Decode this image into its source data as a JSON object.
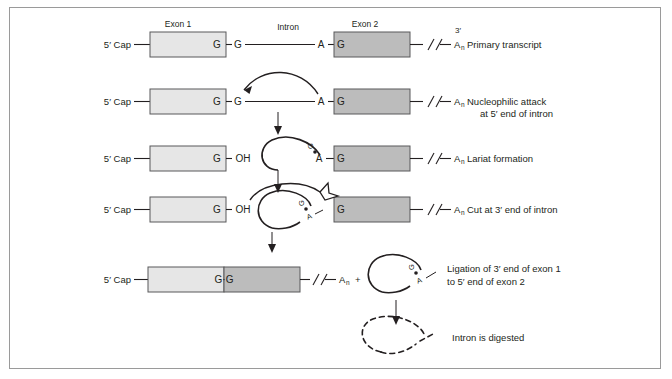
{
  "figure": {
    "cap_label": "5′ Cap",
    "exon1_label": "Exon 1",
    "exon2_label": "Exon 2",
    "intron_label": "Intron",
    "three_prime_label": "3′",
    "poly_a": "A",
    "poly_a_sub": "n",
    "plus_sign": "+",
    "base_g": "G",
    "base_a": "A",
    "base_oh": "OH",
    "product_bases": "G·G",
    "colors": {
      "exon1_fill": "#e6e6e6",
      "exon2_fill": "#bcbcbc",
      "stroke": "#58585a",
      "line": "#231f20",
      "frame": "#9a9a9a"
    }
  },
  "steps": [
    {
      "id": "primary-transcript",
      "label": "Primary transcript",
      "label_line2": ""
    },
    {
      "id": "nucleophilic-attack",
      "label": "Nucleophilic attack",
      "label_line2": "at 5′ end of intron"
    },
    {
      "id": "lariat-formation",
      "label": "Lariat formation",
      "label_line2": ""
    },
    {
      "id": "cut-at-3-prime",
      "label": "Cut at 3′ end of intron",
      "label_line2": ""
    },
    {
      "id": "ligation",
      "label": "Ligation of 3′ end of exon 1",
      "label_line2": "to 5′ end of exon 2"
    },
    {
      "id": "intron-digested",
      "label": "Intron is digested",
      "label_line2": ""
    }
  ]
}
